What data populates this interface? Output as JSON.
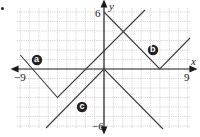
{
  "figure": {
    "bullet": "•",
    "axes": {
      "x_label": "x",
      "y_label": "y",
      "x_min_label": "−9",
      "x_max_label": "9",
      "y_max_label": "6",
      "y_min_label": "−6",
      "xlim": [
        -9,
        9
      ],
      "ylim": [
        -6,
        6
      ]
    },
    "graphs": [
      {
        "id": "a",
        "label": "a",
        "equation": "y = |x + 5| − 3",
        "vertex": [
          -5,
          -3
        ],
        "opens": "up"
      },
      {
        "id": "b",
        "label": "b",
        "equation": "y = |x − 6|",
        "vertex": [
          6,
          0
        ],
        "opens": "up"
      },
      {
        "id": "c",
        "label": "c",
        "equation": "y = −|x|",
        "vertex": [
          0,
          0
        ],
        "opens": "down"
      }
    ],
    "colors": {
      "grid": "#b8b8b8",
      "axis": "#1a1a1a",
      "line": "#3a3a3a",
      "badge": "#222222",
      "badge_text": "#ffffff"
    }
  }
}
